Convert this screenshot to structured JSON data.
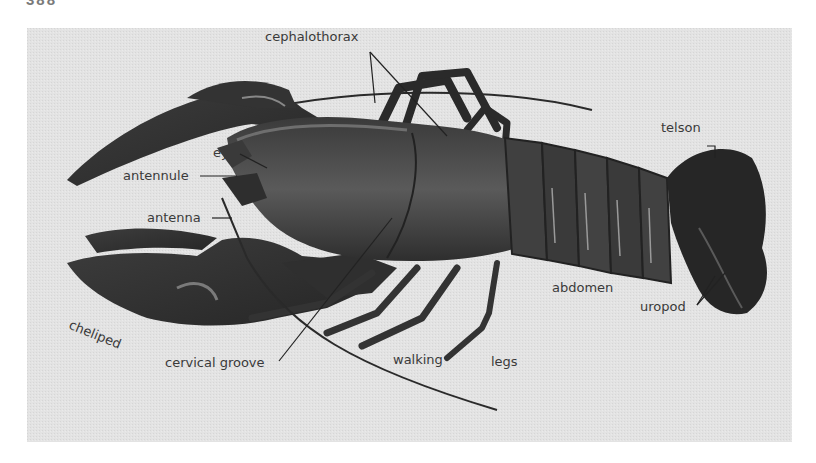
{
  "page": {
    "number": "388"
  },
  "figure": {
    "labels": {
      "cephalothorax": "cephalothorax",
      "telson": "telson",
      "eye": "eye",
      "antennule": "antennule",
      "antenna": "antenna",
      "cheliped": "cheliped",
      "cervical_groove": "cervical groove",
      "walking": "walking",
      "legs": "legs",
      "abdomen": "abdomen",
      "uropod": "uropod"
    },
    "colors": {
      "background": "#e3e3e3",
      "body_dark": "#2e2e2e",
      "body_mid": "#4a4a4a",
      "label_text": "#3a3a3a"
    }
  }
}
